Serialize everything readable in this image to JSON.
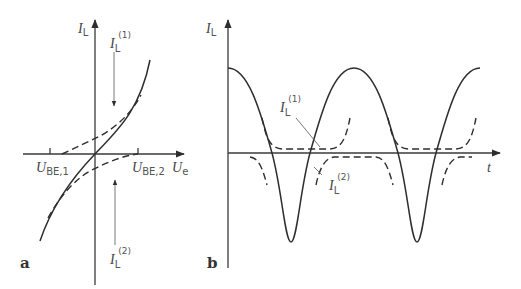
{
  "panel_a": {
    "label": "a",
    "y_axis": {
      "symbol": "I",
      "subscript": "L"
    },
    "x_axis": {
      "symbol": "U",
      "subscript": "e"
    },
    "tick_left": {
      "symbol": "U",
      "subscript": "BE,1"
    },
    "tick_right": {
      "symbol": "U",
      "subscript": "BE,2"
    },
    "current_1": {
      "symbol": "I",
      "subscript": "L",
      "superscript": "(1)"
    },
    "current_2": {
      "symbol": "I",
      "subscript": "L",
      "superscript": "(2)"
    }
  },
  "panel_b": {
    "label": "b",
    "y_axis": {
      "symbol": "I",
      "subscript": "L"
    },
    "x_axis": {
      "symbol": "t"
    },
    "current_1": {
      "symbol": "I",
      "subscript": "L",
      "superscript": "(1)"
    },
    "current_2": {
      "symbol": "I",
      "subscript": "L",
      "superscript": "(2)"
    }
  },
  "colors": {
    "line": "#2e2e2e",
    "text": "#444444",
    "background": "#ffffff"
  }
}
